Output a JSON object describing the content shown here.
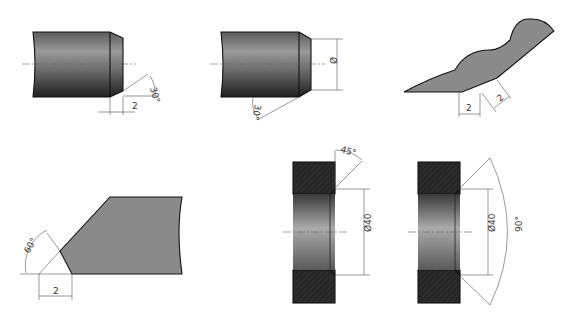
{
  "figures": [
    {
      "id": "shaft-chamfer",
      "labels": {
        "angle": "30°",
        "length": "2"
      }
    },
    {
      "id": "shaft-chamfer-diameter",
      "labels": {
        "angle": "30°",
        "diameter": "Ø"
      }
    },
    {
      "id": "sheet-edge-chamfer",
      "labels": {
        "leg1": "2",
        "leg2": "2"
      }
    },
    {
      "id": "bevel-edge",
      "labels": {
        "angle": "60°",
        "length": "2"
      }
    },
    {
      "id": "bore-chamfer-45",
      "labels": {
        "angle": "45°",
        "diameter": "Ø40"
      }
    },
    {
      "id": "bore-chamfer-90",
      "labels": {
        "angle": "90°",
        "diameter": "Ø40"
      }
    }
  ],
  "colors": {
    "dark_fill": "#2a2a2a",
    "gray_fill": "#8a8a8a",
    "line": "#111111",
    "dim_line": "#555555"
  }
}
